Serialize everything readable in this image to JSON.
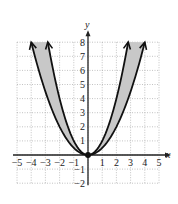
{
  "chart_data": {
    "type": "line",
    "title": "",
    "xlabel": "x",
    "ylabel": "y",
    "xlim": [
      -5,
      5
    ],
    "ylim": [
      -2,
      8
    ],
    "grid": true,
    "x_ticks": [
      -5,
      -4,
      -3,
      -2,
      -1,
      1,
      2,
      3,
      4,
      5
    ],
    "y_ticks": [
      -2,
      -1,
      1,
      2,
      3,
      4,
      5,
      6,
      7,
      8
    ],
    "series": [
      {
        "name": "y = x^2",
        "a": 1,
        "x_range": [
          -2.83,
          2.83
        ],
        "arrows": true
      },
      {
        "name": "y = 1/2 x^2",
        "a": 0.5,
        "x_range": [
          -4,
          4
        ],
        "arrows": true
      }
    ],
    "shaded_region": "between y = x^2 and y = 1/2 x^2",
    "annotations": [
      {
        "type": "point",
        "x": 0,
        "y": 0,
        "filled": true
      }
    ]
  },
  "colors": {
    "curve": "#111111",
    "fill": "#c8c8c8",
    "grid": "#9a9a9a",
    "axis": "#222222"
  }
}
